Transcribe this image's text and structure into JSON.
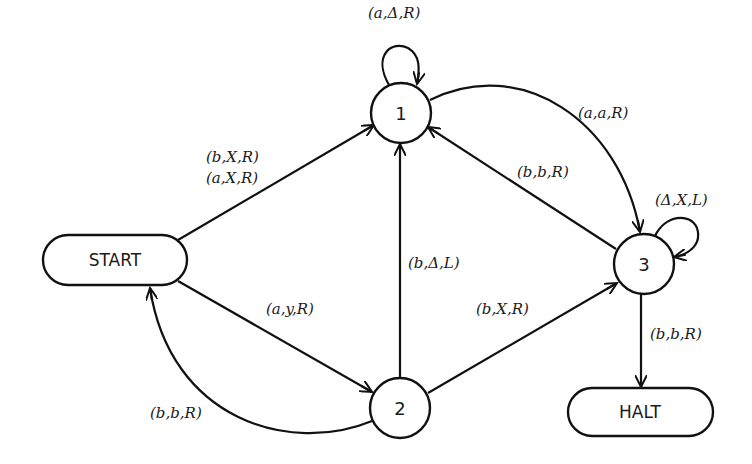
{
  "diagram": {
    "type": "state-transition-diagram",
    "nodes": {
      "start": {
        "label": "START"
      },
      "halt": {
        "label": "HALT"
      },
      "s1": {
        "label": "1"
      },
      "s2": {
        "label": "2"
      },
      "s3": {
        "label": "3"
      }
    },
    "edges": [
      {
        "from": "1",
        "to": "1",
        "label": "(a,Δ,R)"
      },
      {
        "from": "START",
        "to": "1",
        "label_lines": [
          "(b,X,R)",
          "(a,X,R)"
        ]
      },
      {
        "from": "1",
        "to": "3",
        "label": "(a,a,R)"
      },
      {
        "from": "3",
        "to": "1",
        "label": "(b,b,R)"
      },
      {
        "from": "3",
        "to": "3",
        "label": "(Δ,X,L)"
      },
      {
        "from": "2",
        "to": "1",
        "label": "(b,Δ,L)"
      },
      {
        "from": "START",
        "to": "2",
        "label": "(a,y,R)"
      },
      {
        "from": "2",
        "to": "3",
        "label": "(b,X,R)"
      },
      {
        "from": "2",
        "to": "START",
        "label": "(b,b,R)"
      },
      {
        "from": "3",
        "to": "HALT",
        "label": "(b,b,R)"
      }
    ]
  },
  "labels": {
    "loop1": "(a,Δ,R)",
    "start_to_1_a": "(b,X,R)",
    "start_to_1_b": "(a,X,R)",
    "one_to_3": "(a,a,R)",
    "three_to_1": "(b,b,R)",
    "loop3": "(Δ,X,L)",
    "two_to_1": "(b,Δ,L)",
    "start_to_2": "(a,y,R)",
    "two_to_3": "(b,X,R)",
    "two_to_start": "(b,b,R)",
    "three_to_halt": "(b,b,R)"
  }
}
